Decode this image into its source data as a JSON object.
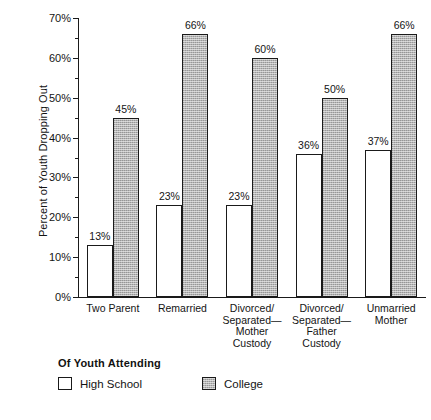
{
  "chart_data": {
    "type": "bar",
    "title": "",
    "xlabel": "",
    "ylabel": "Percent of Youth Dropping Out",
    "ylim": [
      0,
      70
    ],
    "ytick_labels": [
      "0%",
      "10%",
      "20%",
      "30%",
      "40%",
      "50%",
      "60%",
      "70%"
    ],
    "ytick_values": [
      0,
      10,
      20,
      30,
      40,
      50,
      60,
      70
    ],
    "minor_tick_values": [
      5,
      15,
      25,
      35,
      45,
      55,
      65
    ],
    "grid": false,
    "legend_position": "below-axis-left",
    "legend_title": "Of  Youth Attending",
    "categories": [
      "Two Parent",
      "Remarried",
      "Divorced/ Separated— Mother Custody",
      "Divorced/ Separated— Father Custody",
      "Unmarried Mother"
    ],
    "category_lines": [
      [
        "Two Parent"
      ],
      [
        "Remarried"
      ],
      [
        "Divorced/",
        "Separated—",
        "Mother",
        "Custody"
      ],
      [
        "Divorced/",
        "Separated—",
        "Father",
        "Custody"
      ],
      [
        "Unmarried",
        "Mother"
      ]
    ],
    "series": [
      {
        "name": "High School",
        "color": "#ffffff",
        "values": [
          13,
          23,
          23,
          36,
          37
        ],
        "labels": [
          "13%",
          "23%",
          "23%",
          "36%",
          "37%"
        ]
      },
      {
        "name": "College",
        "color": "#b4b4b4",
        "values": [
          45,
          66,
          60,
          50,
          66
        ],
        "labels": [
          "45%",
          "66%",
          "60%",
          "50%",
          "66%"
        ]
      }
    ]
  },
  "legend": {
    "title": "Of  Youth Attending",
    "entries": [
      {
        "label": "High School",
        "swatch": "hs"
      },
      {
        "label": "College",
        "swatch": "col"
      }
    ]
  }
}
